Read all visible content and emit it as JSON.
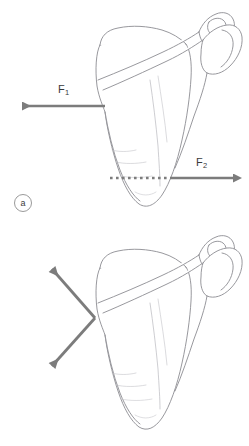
{
  "figure": {
    "background_color": "#ffffff",
    "bone_outline_color": "#8c8c92",
    "bone_fill_color": "#ffffff",
    "arrow_color": "#7c7c7c",
    "label_color": "#3a3a3a",
    "panel_tag_border_color": "#9a9a9a"
  },
  "panels": [
    {
      "id": "a",
      "tag": "a",
      "subject": "scapula-anterior-view",
      "vectors": [
        {
          "name": "F1",
          "label_text": "F",
          "label_sub": "1",
          "direction": "left",
          "start": [
            105,
            106
          ],
          "end": [
            14,
            106
          ],
          "style": "solid"
        },
        {
          "name": "F2",
          "label_text": "F",
          "label_sub": "2",
          "direction": "right",
          "start": [
            172,
            178
          ],
          "end": [
            241,
            178
          ],
          "style": "solid"
        }
      ],
      "guides": [
        {
          "name": "dotted-transverse-line",
          "style": "dotted",
          "start": [
            108,
            178
          ],
          "end": [
            172,
            178
          ]
        }
      ]
    },
    {
      "id": "b",
      "tag": "b",
      "subject": "scapula-anterior-view",
      "vectors": [
        {
          "name": "F1",
          "label_text": "F",
          "label_sub": "1",
          "direction": "up-left",
          "start": [
            95,
            318
          ],
          "end": [
            46,
            262
          ],
          "style": "solid"
        },
        {
          "name": "F2",
          "label_text": "F",
          "label_sub": "2",
          "direction": "down-left",
          "start": [
            95,
            318
          ],
          "end": [
            46,
            372
          ],
          "style": "solid"
        }
      ],
      "guides": []
    }
  ]
}
